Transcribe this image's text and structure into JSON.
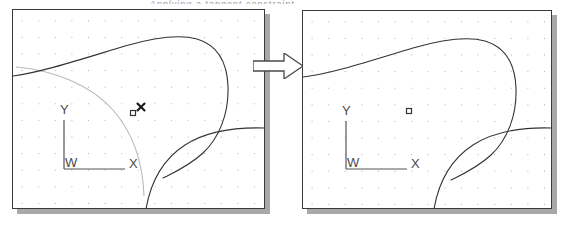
{
  "figure": {
    "kind": "cad-before-after-comparison",
    "width": 567,
    "height": 230,
    "background": "#ffffff",
    "top_text_remnant": "Applying a tangent constraint",
    "colors": {
      "panel_border": "#3a3a3a",
      "panel_shadow": "#a8a8a8",
      "panel_fill": "#ffffff",
      "geometry_stroke": "#333333",
      "construction_stroke": "#b9b9b9",
      "grid_dot": "#b0b0b0",
      "axis_stroke": "#555555",
      "axis_label": "#4a4a4a",
      "marker_stroke": "#333333",
      "cursor_stroke": "#1a1a1a",
      "arrow_fill": "#ffffff",
      "arrow_stroke": "#4a4a4a"
    },
    "grid": {
      "spacing_px": 16.6,
      "dot_size_px": 1
    }
  },
  "arrow": {
    "name": "transition-arrow",
    "direction": "right",
    "x": 253,
    "y": 53,
    "width": 50,
    "height": 26
  },
  "panels": [
    {
      "id": "before",
      "name": "cad-viewport-before",
      "label": "Before",
      "x": 12,
      "y": 9,
      "width": 253,
      "height": 200,
      "shadow_offset": 5,
      "axes": {
        "origin_x": 51,
        "origin_y": 159,
        "y_tip_y": 110,
        "x_tip_x": 112,
        "labels": {
          "y": "Y",
          "x": "X",
          "origin": "W"
        }
      },
      "markers": [
        {
          "name": "point-marker-square",
          "type": "square",
          "x": 120,
          "y": 103,
          "size": 5
        },
        {
          "name": "cursor-crosshair",
          "type": "x-cursor",
          "x": 128,
          "y": 97,
          "size": 7
        }
      ],
      "construction_arc": {
        "name": "construction-arc",
        "visible": true,
        "path": "M 3 57 C 40 60 78 75 100 100 C 120 123 130 154 131 186"
      },
      "geometry": [
        {
          "name": "upper-body-outline",
          "path": "M 0 66 C 30 62 72 48 112 36 C 140 28 166 24 184 29 C 204 35 214 52 215 76 C 216 104 206 128 190 143 C 176 156 160 163 150 168"
        },
        {
          "name": "lower-fillet-outline",
          "path": "M 133 199 C 138 170 152 148 172 135 C 192 122 219 117 252 118"
        }
      ]
    },
    {
      "id": "after",
      "name": "cad-viewport-after",
      "label": "After",
      "x": 302,
      "y": 10,
      "width": 250,
      "height": 199,
      "shadow_offset": 5,
      "axes": {
        "origin_x": 43,
        "origin_y": 158,
        "y_tip_y": 110,
        "x_tip_x": 104,
        "labels": {
          "y": "Y",
          "x": "X",
          "origin": "W"
        }
      },
      "markers": [
        {
          "name": "point-marker-square",
          "type": "square",
          "x": 106,
          "y": 100,
          "size": 5
        }
      ],
      "construction_arc": {
        "name": "construction-arc",
        "visible": false,
        "path": ""
      },
      "geometry": [
        {
          "name": "upper-body-outline",
          "path": "M 0 66 C 28 63 70 49 110 37 C 138 29 164 25 182 30 C 202 36 212 53 213 77 C 214 105 204 129 188 144 C 174 157 158 164 148 169"
        },
        {
          "name": "lower-fillet-outline",
          "path": "M 131 198 C 136 169 150 147 170 134 C 190 121 217 116 249 117"
        }
      ]
    }
  ]
}
